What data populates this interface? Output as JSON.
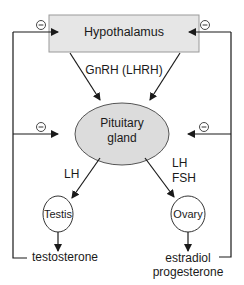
{
  "diagram": {
    "nodes": {
      "hypothalamus": {
        "label": "Hypothalamus",
        "shape": "rectangle",
        "fill": "#e6e6e6"
      },
      "pituitary": {
        "label_line1": "Pituitary",
        "label_line2": "gland",
        "shape": "ellipse",
        "fill": "#dcdcdc"
      },
      "testis": {
        "label": "Testis",
        "shape": "circle"
      },
      "ovary": {
        "label": "Ovary",
        "shape": "circle"
      }
    },
    "edges": {
      "gnrh": {
        "label": "GnRH (LHRH)"
      },
      "lh_left": {
        "label": "LH"
      },
      "lh_fsh_right": {
        "label_line1": "LH",
        "label_line2": "FSH"
      }
    },
    "outputs": {
      "male": {
        "label": "testosterone"
      },
      "female": {
        "label_line1": "estradiol",
        "label_line2": "progesterone"
      }
    },
    "feedback": {
      "symbol": "−",
      "description": "negative feedback"
    }
  }
}
